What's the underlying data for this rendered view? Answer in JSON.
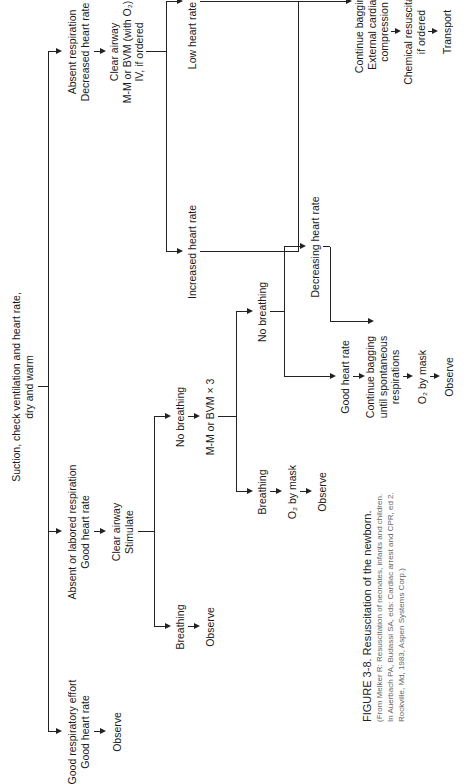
{
  "diagram": {
    "root": [
      "Suction, check ventilation and heart rate,",
      "dry and warm"
    ],
    "branch_good": {
      "condition": [
        "Good respiratory effort",
        "Good heart rate"
      ],
      "action": "Observe"
    },
    "branch_labored": {
      "condition": [
        "Absent or labored respiration",
        "Good heart rate"
      ],
      "action": [
        "Clear airway",
        "Stimulate"
      ],
      "breathing": {
        "label": "Breathing",
        "action": "Observe"
      },
      "no_breathing": {
        "label": "No breathing",
        "action": "M-M or BVM × 3",
        "breathing": {
          "label": "Breathing",
          "action": "O₂ by mask",
          "then": "Observe"
        },
        "no_breathing": {
          "label": "No breathing",
          "good_hr": {
            "label": "Good heart rate",
            "action": [
              "Continue bagging",
              "until spontaneous",
              "respirations"
            ],
            "then": "O₂ by mask",
            "final": "Observe"
          },
          "decreasing_hr": {
            "label": "Decreasing heart rate"
          }
        }
      }
    },
    "branch_absent": {
      "condition": [
        "Absent respiration",
        "Decreased heart rate"
      ],
      "action": [
        "Clear airway",
        "M-M or BVM (with O₂)",
        "IV, if ordered"
      ],
      "increased_hr": {
        "label": "Increased heart rate"
      },
      "low_hr": {
        "label": "Low heart rate",
        "action": [
          "Continue bagging",
          "External cardiac",
          "compression"
        ],
        "then": [
          "Chemical resuscitation",
          "if ordered"
        ],
        "final": "Transport"
      }
    }
  },
  "caption": {
    "title": "FIGURE 3-8. Resuscitation of the newborn.",
    "source": "(From Melker R: Resuscitation of neonates, infants and children. In Auerbach PA, Budassi SA, eds: Cardiac arrest and CPR, ed 2. Rockville, Md, 1983, Aspen Systems Corp.)"
  }
}
